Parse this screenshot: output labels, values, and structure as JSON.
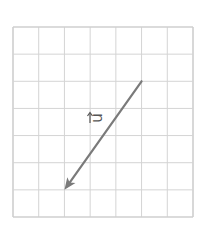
{
  "diagram": {
    "grid": {
      "cols": 7,
      "rows": 7,
      "line_color": "#d4d4d4",
      "border_color": "#cfcfcf"
    },
    "vector": {
      "label": "u",
      "color": "#7a7a7a",
      "from_cell": [
        5,
        2
      ],
      "to_cell": [
        2,
        6
      ]
    }
  }
}
